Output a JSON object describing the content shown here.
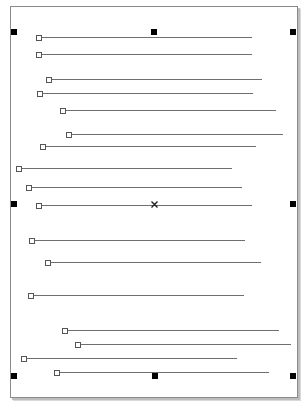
{
  "canvas": {
    "page_color": "#ffffff",
    "border_color": "#8a8a8a",
    "line_color": "#6f6f6f"
  },
  "lines": [
    {
      "y": 37,
      "x1": 39,
      "x2": 252
    },
    {
      "y": 54,
      "x1": 39,
      "x2": 252
    },
    {
      "y": 79,
      "x1": 49,
      "x2": 262
    },
    {
      "y": 93,
      "x1": 40,
      "x2": 253
    },
    {
      "y": 110,
      "x1": 63,
      "x2": 276
    },
    {
      "y": 134,
      "x1": 69,
      "x2": 283
    },
    {
      "y": 146,
      "x1": 43,
      "x2": 256
    },
    {
      "y": 168,
      "x1": 19,
      "x2": 232
    },
    {
      "y": 187,
      "x1": 29,
      "x2": 242
    },
    {
      "y": 205,
      "x1": 39,
      "x2": 252
    },
    {
      "y": 240,
      "x1": 32,
      "x2": 245
    },
    {
      "y": 262,
      "x1": 48,
      "x2": 261
    },
    {
      "y": 295,
      "x1": 31,
      "x2": 244
    },
    {
      "y": 330,
      "x1": 65,
      "x2": 279
    },
    {
      "y": 344,
      "x1": 78,
      "x2": 291
    },
    {
      "y": 358,
      "x1": 24,
      "x2": 237
    },
    {
      "y": 372,
      "x1": 57,
      "x2": 269
    }
  ],
  "selection_handles": [
    {
      "name": "top-left",
      "x": 14,
      "y": 32
    },
    {
      "name": "top-center",
      "x": 154,
      "y": 32
    },
    {
      "name": "top-right",
      "x": 293,
      "y": 32
    },
    {
      "name": "middle-left",
      "x": 14,
      "y": 204
    },
    {
      "name": "middle-right",
      "x": 293,
      "y": 204
    },
    {
      "name": "bottom-left",
      "x": 14,
      "y": 376
    },
    {
      "name": "bottom-center",
      "x": 155,
      "y": 376
    },
    {
      "name": "bottom-right",
      "x": 293,
      "y": 376
    }
  ],
  "center_marker": {
    "x": 154,
    "y": 204,
    "glyph": "×"
  }
}
